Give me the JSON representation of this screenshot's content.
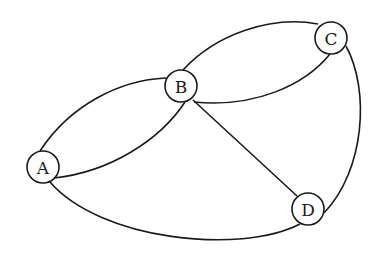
{
  "diagram": {
    "type": "multigraph",
    "nodes": [
      {
        "id": "A",
        "label": "A",
        "x": 43,
        "y": 167
      },
      {
        "id": "B",
        "label": "B",
        "x": 181,
        "y": 86
      },
      {
        "id": "C",
        "label": "C",
        "x": 331,
        "y": 38
      },
      {
        "id": "D",
        "label": "D",
        "x": 308,
        "y": 209
      }
    ],
    "edges": [
      {
        "from": "A",
        "to": "B",
        "curve": "upper"
      },
      {
        "from": "A",
        "to": "B",
        "curve": "lower"
      },
      {
        "from": "B",
        "to": "C",
        "curve": "upper"
      },
      {
        "from": "B",
        "to": "C",
        "curve": "lower"
      },
      {
        "from": "B",
        "to": "D",
        "curve": "straight"
      },
      {
        "from": "A",
        "to": "D",
        "curve": "lower"
      },
      {
        "from": "C",
        "to": "D",
        "curve": "right"
      }
    ],
    "colors": {
      "stroke": "#1a1a1a",
      "background": "#ffffff"
    }
  }
}
